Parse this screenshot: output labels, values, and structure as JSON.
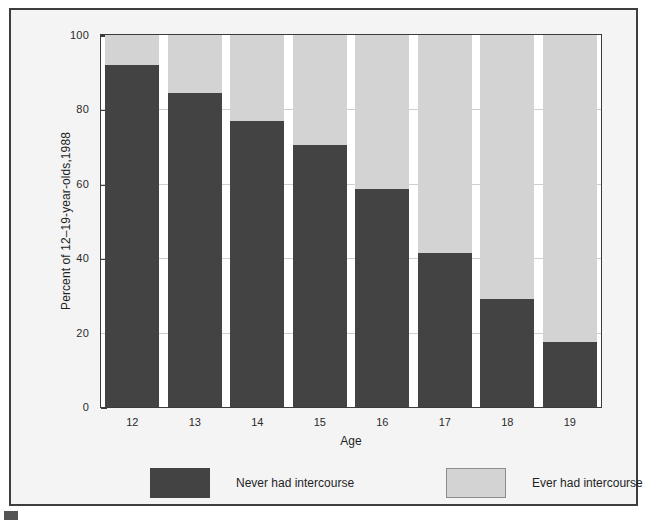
{
  "chart_data": {
    "type": "bar",
    "subtype": "stacked-percentage",
    "title": "",
    "xlabel": "Age",
    "ylabel": "Percent of 12–19-year-olds,1988",
    "categories": [
      "12",
      "13",
      "14",
      "15",
      "16",
      "17",
      "18",
      "19"
    ],
    "series": [
      {
        "name": "Never had intercourse",
        "color": "#434343",
        "values": [
          92,
          84.5,
          77,
          70.5,
          58.5,
          41.5,
          29,
          17.5
        ]
      },
      {
        "name": "Ever had intercourse",
        "color": "#d3d3d3",
        "values": [
          8,
          15.5,
          23,
          29.5,
          41.5,
          58.5,
          71,
          82.5
        ]
      }
    ],
    "ylim": [
      0,
      100
    ],
    "yticks": [
      0,
      20,
      40,
      60,
      80,
      100
    ],
    "ytick_labels": [
      "0",
      "20",
      "40",
      "60",
      "80",
      "100"
    ],
    "grid": true,
    "grid_axis": "y",
    "legend_position": "bottom",
    "legend": [
      {
        "label": "Never had intercourse",
        "color": "#434343",
        "swatch": "dark-swatch"
      },
      {
        "label": "Ever had intercourse",
        "color": "#d3d3d3",
        "swatch": "light-swatch"
      }
    ]
  },
  "figure": {
    "frame_color": "#3e3e3e",
    "background": "#f4f4f4",
    "plot_background": "#ffffff"
  }
}
